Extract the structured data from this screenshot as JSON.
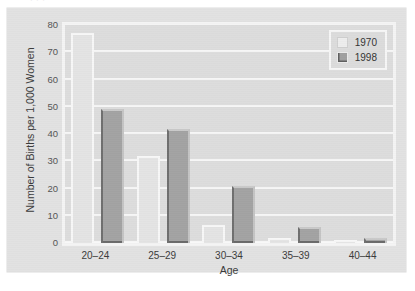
{
  "clipped_top_text": "· · ·",
  "chart_data": {
    "type": "bar",
    "title": "",
    "categories": [
      "20–24",
      "25–29",
      "30–34",
      "35–39",
      "40–44"
    ],
    "series": [
      {
        "name": "1970",
        "values": [
          77,
          32,
          6.5,
          2,
          0.5
        ],
        "color": "#e4e4e4"
      },
      {
        "name": "1998",
        "values": [
          49,
          42,
          21,
          6,
          2
        ],
        "color": "#a3a3a3"
      }
    ],
    "xlabel": "Age",
    "ylabel": "Number of Births per 1,000 Women",
    "ylim": [
      0,
      80
    ],
    "yticks": [
      0,
      10,
      20,
      30,
      40,
      50,
      60,
      70,
      80
    ],
    "ytick_labels": [
      "0",
      "10",
      "20",
      "30",
      "40",
      "50",
      "60",
      "70",
      "80"
    ],
    "grid": true,
    "legend_position": "top-right"
  },
  "legend": {
    "entries": [
      {
        "label": "1970",
        "swatch": "light-square-swatch"
      },
      {
        "label": "1998",
        "swatch": "dark-square-swatch"
      }
    ]
  }
}
